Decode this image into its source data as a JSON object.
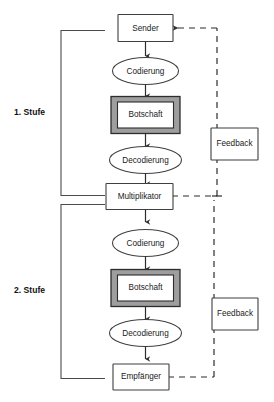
{
  "diagram": {
    "type": "flowchart",
    "colors": {
      "frame_fill": "#9e9e9e",
      "node_fill": "#ffffff",
      "stroke": "#2d2d2d",
      "background": "#ffffff"
    },
    "stages": [
      {
        "id": "stage-1",
        "label": "1. Stufe"
      },
      {
        "id": "stage-2",
        "label": "2. Stufe"
      }
    ],
    "nodes": [
      {
        "id": "sender",
        "label": "Sender",
        "shape": "rect",
        "stage": "stage-1"
      },
      {
        "id": "codierung-1",
        "label": "Codierung",
        "shape": "ellipse",
        "stage": "stage-1"
      },
      {
        "id": "botschaft-1",
        "label": "Botschaft",
        "shape": "framed-rect",
        "stage": "stage-1"
      },
      {
        "id": "decodierung-1",
        "label": "Decodierung",
        "shape": "ellipse",
        "stage": "stage-1"
      },
      {
        "id": "multiplikator",
        "label": "Multiplikator",
        "shape": "rect",
        "stage": "stage-1"
      },
      {
        "id": "codierung-2",
        "label": "Codierung",
        "shape": "ellipse",
        "stage": "stage-2"
      },
      {
        "id": "botschaft-2",
        "label": "Botschaft",
        "shape": "framed-rect",
        "stage": "stage-2"
      },
      {
        "id": "decodierung-2",
        "label": "Decodierung",
        "shape": "ellipse",
        "stage": "stage-2"
      },
      {
        "id": "empfaenger",
        "label": "Empfänger",
        "shape": "rect",
        "stage": "stage-2"
      },
      {
        "id": "feedback-1",
        "label": "Feedback",
        "shape": "rect",
        "stage": "stage-1"
      },
      {
        "id": "feedback-2",
        "label": "Feedback",
        "shape": "rect",
        "stage": "stage-2"
      }
    ],
    "edges": [
      {
        "from": "sender",
        "to": "codierung-1",
        "style": "solid",
        "arrow": true
      },
      {
        "from": "codierung-1",
        "to": "botschaft-1",
        "style": "solid",
        "arrow": true
      },
      {
        "from": "botschaft-1",
        "to": "decodierung-1",
        "style": "solid",
        "arrow": true
      },
      {
        "from": "decodierung-1",
        "to": "multiplikator",
        "style": "solid",
        "arrow": true
      },
      {
        "from": "multiplikator",
        "to": "codierung-2",
        "style": "solid",
        "arrow": true
      },
      {
        "from": "codierung-2",
        "to": "botschaft-2",
        "style": "solid",
        "arrow": true
      },
      {
        "from": "botschaft-2",
        "to": "decodierung-2",
        "style": "solid",
        "arrow": true
      },
      {
        "from": "decodierung-2",
        "to": "empfaenger",
        "style": "solid",
        "arrow": true
      },
      {
        "from": "multiplikator",
        "to": "sender",
        "style": "dashed",
        "arrow": true,
        "via": "feedback-1"
      },
      {
        "from": "empfaenger",
        "to": "multiplikator",
        "style": "dashed",
        "arrow": false,
        "via": "feedback-2"
      }
    ]
  }
}
